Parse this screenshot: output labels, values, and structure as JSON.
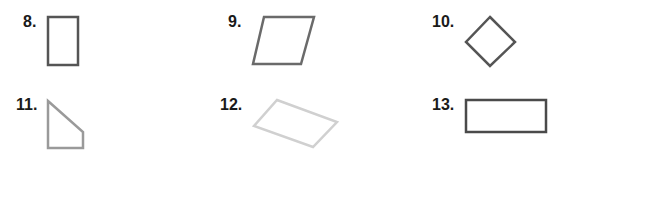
{
  "problems": [
    {
      "number": "8.",
      "shape": "tall-rectangle",
      "stroke": "#555555"
    },
    {
      "number": "9.",
      "shape": "parallelogram",
      "stroke": "#6a6a6a"
    },
    {
      "number": "10.",
      "shape": "rhombus-diamond",
      "stroke": "#555555"
    },
    {
      "number": "11.",
      "shape": "trapezoid-quadrilateral",
      "stroke": "#9a9a9a"
    },
    {
      "number": "12.",
      "shape": "tilted-parallelogram",
      "stroke": "#d0d0d0"
    },
    {
      "number": "13.",
      "shape": "wide-rectangle",
      "stroke": "#4a4a4a"
    }
  ]
}
